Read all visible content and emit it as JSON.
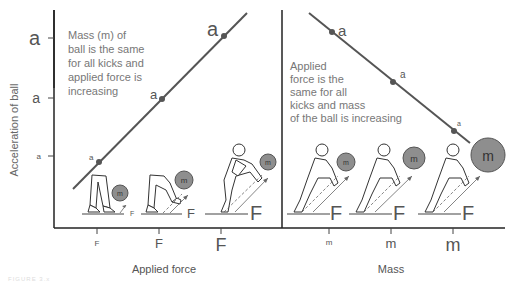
{
  "y_axis": {
    "label": "Acceleration of ball",
    "ticks": [
      {
        "label": "a",
        "size": "large"
      },
      {
        "label": "a",
        "size": "medium"
      },
      {
        "label": "a",
        "size": "small"
      }
    ]
  },
  "left_panel": {
    "note": [
      "Mass (m) of",
      "ball is the same",
      "for all kicks and",
      "applied force is",
      "increasing"
    ],
    "x_axis_label": "Applied force",
    "x_ticks": [
      "F",
      "F",
      "F"
    ],
    "point_labels": [
      "a",
      "a",
      "a"
    ],
    "kicks": [
      {
        "force_label": "F",
        "ball_label": "m"
      },
      {
        "force_label": "F",
        "ball_label": "m"
      },
      {
        "force_label": "F",
        "ball_label": "m"
      }
    ]
  },
  "right_panel": {
    "note": [
      "Applied",
      "force is the",
      "same for all",
      "kicks and mass",
      "of the ball is increasing"
    ],
    "x_axis_label": "Mass",
    "x_ticks": [
      "m",
      "m",
      "m"
    ],
    "point_labels": [
      "a",
      "a",
      "a"
    ],
    "kicks": [
      {
        "force_label": "F",
        "ball_label": "m"
      },
      {
        "force_label": "F",
        "ball_label": "m"
      },
      {
        "force_label": "F",
        "ball_label": "m"
      }
    ]
  },
  "caption_fragment": "FIGURE 3.x",
  "colors": {
    "line": "#555555",
    "ball": "#8e8e8e",
    "text": "#555555"
  }
}
